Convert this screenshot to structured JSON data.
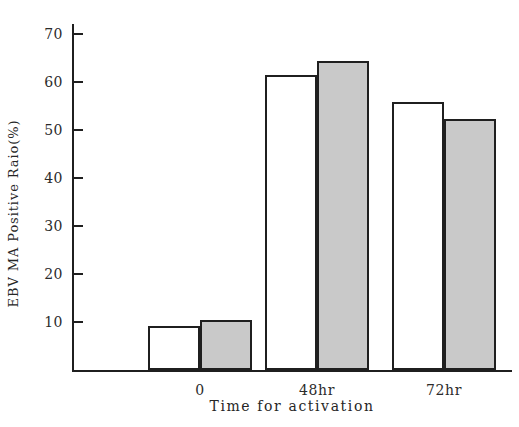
{
  "chart_data": {
    "type": "bar",
    "title": "",
    "xlabel": "Time for activation",
    "ylabel": "EBV MA Positive Raio(%)",
    "categories": [
      "0",
      "48hr",
      "72hr"
    ],
    "series": [
      {
        "name": "open",
        "values": [
          9.1,
          61.4,
          55.8
        ],
        "color": "#ffffff"
      },
      {
        "name": "shaded",
        "values": [
          10.5,
          64.3,
          52.3
        ],
        "color": "#c9c9c9"
      }
    ],
    "ylim": [
      0,
      72
    ],
    "yticks": [
      10,
      20,
      30,
      40,
      50,
      60,
      70
    ],
    "ytick_labels": [
      "10",
      "20",
      "30",
      "40",
      "50",
      "60",
      "70"
    ],
    "grid": false,
    "legend": "none"
  }
}
